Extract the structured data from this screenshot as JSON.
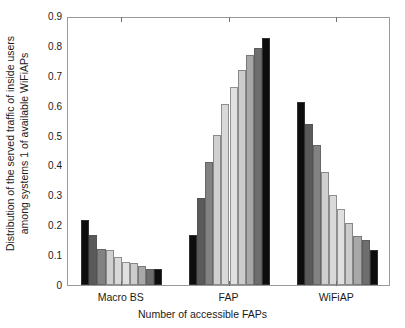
{
  "chart_data": {
    "type": "bar",
    "title": "",
    "xlabel": "Number of accessible FAPs",
    "ylabel_line1": "Distribution of the served traffic of inside users",
    "ylabel_line2": "among systems 1 of available  WiFiAPs",
    "ylim": [
      0,
      0.9
    ],
    "ytick_labels": [
      "0",
      "0.1",
      "0.2",
      "0.3",
      "0.4",
      "0.5",
      "0.6",
      "0.7",
      "0.8",
      "0.9"
    ],
    "ytick_values": [
      0,
      0.1,
      0.2,
      0.3,
      0.4,
      0.5,
      0.6,
      0.7,
      0.8,
      0.9
    ],
    "grid": false,
    "legend": "none",
    "categories": [
      "Macro BS",
      "FAP",
      "WiFiAP"
    ],
    "bars_per_group": 10,
    "bar_colors": [
      "#0d0d0d",
      "#5a5a5a",
      "#828282",
      "#cfcfcf",
      "#d9d9d9",
      "#e0e0e0",
      "#cccccc",
      "#a8a8a8",
      "#6e6e6e",
      "#0d0d0d"
    ],
    "groups": [
      {
        "label": "Macro BS",
        "values": [
          0.216,
          0.167,
          0.119,
          0.118,
          0.094,
          0.078,
          0.072,
          0.062,
          0.053,
          0.053
        ]
      },
      {
        "label": "FAP",
        "values": [
          0.167,
          0.29,
          0.411,
          0.502,
          0.606,
          0.662,
          0.72,
          0.77,
          0.792,
          0.825
        ]
      },
      {
        "label": "WiFiAP",
        "values": [
          0.611,
          0.54,
          0.468,
          0.379,
          0.3,
          0.254,
          0.206,
          0.164,
          0.15,
          0.116
        ]
      }
    ]
  }
}
